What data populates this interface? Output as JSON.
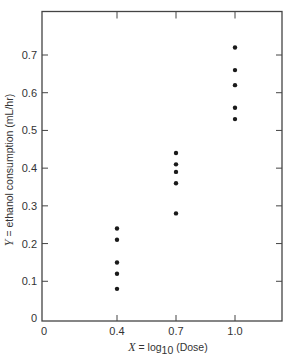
{
  "chart_data": {
    "type": "scatter",
    "title": "",
    "xlabel": "X = log10 (Dose)",
    "xlabel_parts": {
      "var": "X",
      "eq": " = log",
      "sub": "10",
      "rest": " (Dose)"
    },
    "ylabel": "Y = ethanol consumption (mL/hr)",
    "ylabel_parts": {
      "var": "Y",
      "rest": " = ethanol consumption (mL/hr)"
    },
    "xlim": [
      0,
      1.2
    ],
    "ylim": [
      0,
      0.8
    ],
    "x_ticks": [
      0,
      0.4,
      0.7,
      1.0
    ],
    "x_tick_labels": [
      "0",
      "0.4",
      "0.7",
      "1.0"
    ],
    "y_ticks": [
      0,
      0.1,
      0.2,
      0.3,
      0.4,
      0.5,
      0.6,
      0.7
    ],
    "y_tick_labels": [
      "0",
      "0.1",
      "0.2",
      "0.3",
      "0.4",
      "0.5",
      "0.6",
      "0.7"
    ],
    "grid": false,
    "legend": null,
    "frame": "box with inner ticks on top and right",
    "series": [
      {
        "name": "observations",
        "marker": "filled-circle",
        "color": "#1a1a1a",
        "points": [
          {
            "x": 0.4,
            "y": 0.24
          },
          {
            "x": 0.4,
            "y": 0.21
          },
          {
            "x": 0.4,
            "y": 0.15
          },
          {
            "x": 0.4,
            "y": 0.12
          },
          {
            "x": 0.4,
            "y": 0.08
          },
          {
            "x": 0.7,
            "y": 0.44
          },
          {
            "x": 0.7,
            "y": 0.41
          },
          {
            "x": 0.7,
            "y": 0.39
          },
          {
            "x": 0.7,
            "y": 0.36
          },
          {
            "x": 0.7,
            "y": 0.28
          },
          {
            "x": 1.0,
            "y": 0.72
          },
          {
            "x": 1.0,
            "y": 0.66
          },
          {
            "x": 1.0,
            "y": 0.62
          },
          {
            "x": 1.0,
            "y": 0.56
          },
          {
            "x": 1.0,
            "y": 0.53
          }
        ]
      }
    ]
  },
  "colors": {
    "axis": "#444444",
    "points": "#1a1a1a",
    "background": "#ffffff"
  }
}
